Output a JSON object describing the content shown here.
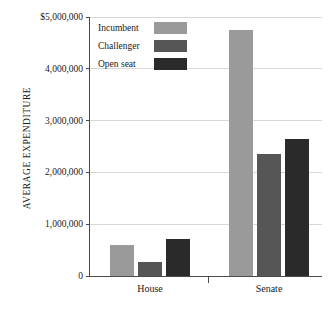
{
  "chart_data": {
    "type": "bar",
    "title": "",
    "xlabel": "",
    "ylabel": "AVERAGE EXPENDITURE",
    "categories": [
      "House",
      "Senate"
    ],
    "series": [
      {
        "name": "Incumbent",
        "values": [
          600000,
          4750000
        ],
        "color": "#9a9a9a"
      },
      {
        "name": "Challenger",
        "values": [
          275000,
          2350000
        ],
        "color": "#565656"
      },
      {
        "name": "Open seat",
        "values": [
          715000,
          2650000
        ],
        "color": "#2a2a2a"
      }
    ],
    "ylim": [
      0,
      5000000
    ],
    "yticks": [
      0,
      1000000,
      2000000,
      3000000,
      4000000,
      5000000
    ],
    "ytick_labels": [
      "0",
      "1,000,000",
      "2,000,000",
      "3,000,000",
      "4,000,000",
      "$5,000,000"
    ],
    "grid": true,
    "legend_position": "top-left"
  },
  "legend": {
    "items": [
      {
        "label": "Incumbent"
      },
      {
        "label": "Challenger"
      },
      {
        "label": "Open seat"
      }
    ]
  },
  "axes": {
    "y_title": "AVERAGE EXPENDITURE",
    "y_labels": {
      "t0": "0",
      "t1": "1,000,000",
      "t2": "2,000,000",
      "t3": "3,000,000",
      "t4": "4,000,000",
      "t5": "$5,000,000"
    },
    "x_labels": {
      "g0": "House",
      "g1": "Senate"
    }
  }
}
